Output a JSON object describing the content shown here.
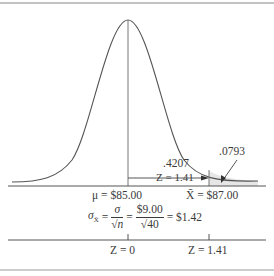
{
  "diagram": {
    "type": "normal-distribution-sampling",
    "colors": {
      "line": "#555555",
      "shade": "#e6e6e6",
      "border": "#888888"
    },
    "annotations": {
      "left_area": ".4207",
      "left_z": "Z = 1.41",
      "tail_area": ".0793"
    },
    "x_axis": {
      "mu_label": "μ = $85.00",
      "xbar_label": "X̄ = $87.00"
    },
    "formula": {
      "lhs": "σ",
      "lhs_sub": "X̄",
      "eq1": "=",
      "frac1_num": "σ",
      "frac1_den": "√n",
      "eq2": "=",
      "frac2_num": "$9.00",
      "frac2_den": "√40",
      "eq3": "= $1.42"
    },
    "z_axis": {
      "z0_label": "Z = 0",
      "z1_label": "Z = 1.41"
    }
  }
}
